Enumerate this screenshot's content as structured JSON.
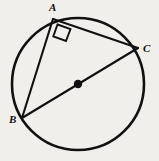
{
  "figure": {
    "kind": "circle-geometry-diagram",
    "background_color": "#f1efec",
    "stroke_color": "#111111",
    "width": 159,
    "height": 161,
    "circle": {
      "name": "circumscribed-circle",
      "cx": 78,
      "cy": 84,
      "r": 66,
      "stroke_width": 2.6,
      "fill": "none"
    },
    "center_point": {
      "name": "circle-center-dot",
      "cx": 78,
      "cy": 84,
      "r": 4.2,
      "fill": "#111111"
    },
    "vertices": [
      {
        "id": "A",
        "label": "A",
        "x": 53,
        "y": 19,
        "label_x": 49,
        "label_y": 2
      },
      {
        "id": "C",
        "label": "C",
        "x": 138,
        "y": 48,
        "label_x": 143,
        "label_y": 43
      },
      {
        "id": "B",
        "label": "B",
        "x": 22,
        "y": 118,
        "label_x": 9,
        "label_y": 114
      }
    ],
    "segments": [
      {
        "name": "chord-AC",
        "from": "A",
        "to": "C",
        "x1": 53,
        "y1": 19,
        "x2": 138,
        "y2": 48,
        "stroke_width": 2.1
      },
      {
        "name": "chord-AB",
        "from": "A",
        "to": "B",
        "x1": 53,
        "y1": 19,
        "x2": 22,
        "y2": 118,
        "stroke_width": 2.1
      },
      {
        "name": "diameter-BC",
        "from": "B",
        "to": "C",
        "x1": 22,
        "y1": 118,
        "x2": 138,
        "y2": 48,
        "stroke_width": 2.1
      }
    ],
    "right_angle_marker": {
      "name": "right-angle-at-A",
      "at_vertex": "A",
      "measure": "90",
      "points": "57.5,24.5 70.5,29.0 66.0,41.0 53.3,36.4",
      "stroke_width": 1.9
    }
  }
}
